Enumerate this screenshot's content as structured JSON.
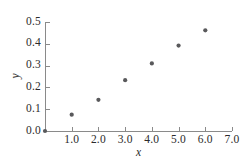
{
  "chart_data": {
    "type": "scatter",
    "title": "",
    "subtitle": "",
    "xlabel": "x",
    "ylabel": "y",
    "xlim": [
      0,
      7.0
    ],
    "ylim": [
      0.0,
      0.5
    ],
    "grid": false,
    "legend": null,
    "marker": {
      "shape": "circle",
      "color": "#59595b",
      "size_px": 4.2
    },
    "axis_color": "#8a8a8a",
    "text_color": "#2b2b2b",
    "xticks": [
      1.0,
      2.0,
      3.0,
      4.0,
      5.0,
      6.0,
      7.0
    ],
    "xtick_labels": [
      "1.0",
      "2.0",
      "3.0",
      "4.0",
      "5.0",
      "6.0",
      "7.0"
    ],
    "yticks": [
      0.0,
      0.1,
      0.2,
      0.3,
      0.4,
      0.5
    ],
    "ytick_labels": [
      "0.0",
      "0.1",
      "0.2",
      "0.3",
      "0.4",
      "0.5"
    ],
    "x": [
      0.0,
      1.0,
      2.0,
      3.0,
      4.0,
      5.0,
      6.0
    ],
    "values": [
      0.0,
      0.075,
      0.143,
      0.233,
      0.31,
      0.392,
      0.462
    ],
    "points": [
      {
        "x": 0.0,
        "y": 0.0
      },
      {
        "x": 1.0,
        "y": 0.075
      },
      {
        "x": 2.0,
        "y": 0.143
      },
      {
        "x": 3.0,
        "y": 0.233
      },
      {
        "x": 4.0,
        "y": 0.31
      },
      {
        "x": 5.0,
        "y": 0.392
      },
      {
        "x": 6.0,
        "y": 0.462
      }
    ]
  }
}
